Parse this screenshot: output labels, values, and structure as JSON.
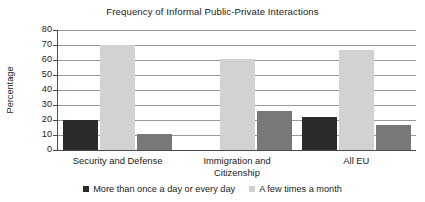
{
  "chart_data": {
    "type": "bar",
    "title": "Frequency of Informal Public-Private Interactions",
    "xlabel": "",
    "ylabel": "Percentage",
    "ylim": [
      0,
      80
    ],
    "ytick_step": 10,
    "yticks": [
      "80",
      "70",
      "60",
      "50",
      "40",
      "30",
      "20",
      "10",
      "0"
    ],
    "grid": true,
    "legend_position": "bottom",
    "categories": [
      "Security and Defense",
      "Immigration and\nCitizenship",
      "All EU"
    ],
    "category_labels": [
      {
        "line1": "Security and Defense",
        "line2": ""
      },
      {
        "line1": "Immigration and",
        "line2": "Citizenship"
      },
      {
        "line1": "All EU",
        "line2": ""
      }
    ],
    "series": [
      {
        "name": "More than once a day or every day",
        "color": "#2b2b2b",
        "values": [
          20,
          0,
          22
        ]
      },
      {
        "name": "A few times a month",
        "color": "#d2d2d2",
        "values": [
          70,
          61,
          67
        ]
      },
      {
        "name": "",
        "color": "#787878",
        "values": [
          10.5,
          26,
          17
        ]
      }
    ],
    "legend": [
      {
        "label": "More than once a day or every day",
        "color": "#2b2b2b"
      },
      {
        "label": "A few times a month",
        "color": "#d2d2d2"
      }
    ],
    "colors": {
      "series_dark": "#2b2b2b",
      "series_light": "#d2d2d2",
      "series_medium": "#787878",
      "gridline": "#9a9a9a",
      "axis": "#4a4a4a",
      "text": "#1b1b1b",
      "background": "#ffffff"
    }
  }
}
